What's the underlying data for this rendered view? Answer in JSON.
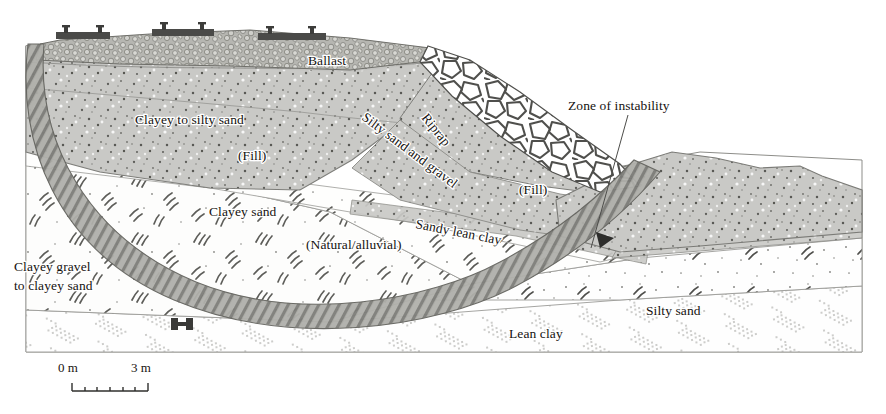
{
  "figure": {
    "kind": "geotechnical-cross-section",
    "background_color": "#ffffff"
  },
  "labels": {
    "ballast": "Ballast",
    "riprap": "Riprap",
    "silty_sand_and_gravel": "Silty sand and gravel",
    "clayey_to_silty_sand": "Clayey to silty sand",
    "fill_left": "(Fill)",
    "fill_right": "(Fill)",
    "clayey_sand": "Clayey sand",
    "natural_alluvial": "(Natural/alluvial)",
    "sandy_lean_clay": "Sandy lean clay",
    "clayey_gravel_line1": "Clayey gravel",
    "clayey_gravel_line2": "to clayey sand",
    "lean_clay": "Lean clay",
    "silty_sand": "Silty sand",
    "zone_of_instability": "Zone of instability"
  },
  "scale_bar": {
    "start_label": "0 m",
    "end_label": "3 m",
    "units": "m",
    "start_value": 0,
    "end_value": 3,
    "minor_divisions": 6
  },
  "colors": {
    "embankment_fill": "#c9c9c6",
    "ballast_fill": "#b9b9b4",
    "tie_dark": "#4a4a48",
    "slip_surface": "#8e8e8a",
    "outline": "#6f6f6b",
    "hatch_stroke": "#7c7c78",
    "clay_stipple": "#9a9a96",
    "text": "#15120f",
    "leader_line": "#4d4d4a",
    "paper": "#ffffff"
  },
  "units_layers": [
    {
      "id": "ballast",
      "name": "Ballast",
      "material": "crushed rock ballast",
      "position": "top of embankment"
    },
    {
      "id": "riprap",
      "name": "Riprap",
      "material": "large angular rock armour",
      "position": "right face of embankment"
    },
    {
      "id": "silty-sand-and-gravel",
      "name": "Silty sand and gravel",
      "material": "fill",
      "position": "right embankment slope"
    },
    {
      "id": "clayey-to-silty-sand",
      "name": "Clayey to silty sand",
      "material": "fill",
      "position": "embankment core"
    },
    {
      "id": "clayey-sand",
      "name": "Clayey sand",
      "material": "natural/alluvial",
      "position": "beneath embankment"
    },
    {
      "id": "sandy-lean-clay",
      "name": "Sandy lean clay",
      "material": "natural/alluvial",
      "position": "thin band, right of centre"
    },
    {
      "id": "clayey-gravel-to-clayey-sand",
      "name": "Clayey gravel to clayey sand",
      "material": "natural",
      "position": "left foundation"
    },
    {
      "id": "silty-sand",
      "name": "Silty sand",
      "material": "natural",
      "position": "right foundation"
    },
    {
      "id": "lean-clay",
      "name": "Lean clay",
      "material": "natural",
      "position": "base of section"
    }
  ],
  "annotations": [
    {
      "id": "zone-of-instability",
      "text": "Zone of instability",
      "points_to": "slip surface through embankment toe"
    },
    {
      "id": "movement-arrow",
      "text": "",
      "points_to": "direction of movement along slip surface"
    }
  ]
}
